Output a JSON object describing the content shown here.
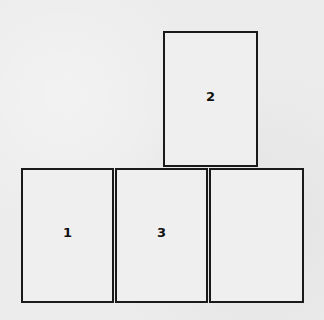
{
  "diagram": {
    "boxes": [
      {
        "id": "box-top",
        "label": "2",
        "x": 163,
        "y": 31,
        "w": 95,
        "h": 136
      },
      {
        "id": "box-bottom-left",
        "label": "1",
        "x": 21,
        "y": 168,
        "w": 93,
        "h": 135
      },
      {
        "id": "box-bottom-middle",
        "label": "3",
        "x": 115,
        "y": 168,
        "w": 93,
        "h": 135
      },
      {
        "id": "box-bottom-right",
        "label": "",
        "x": 209,
        "y": 168,
        "w": 95,
        "h": 135
      }
    ]
  }
}
